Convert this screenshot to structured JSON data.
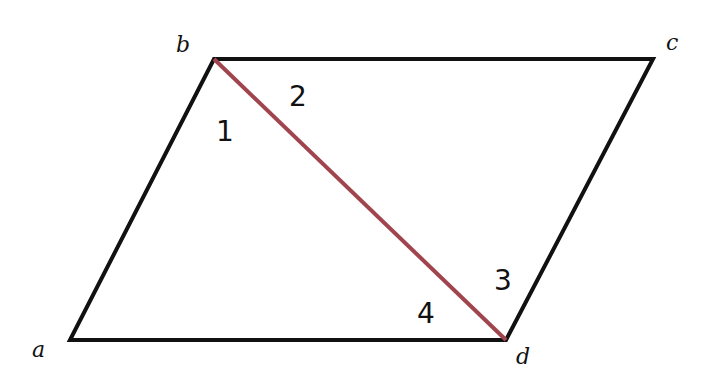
{
  "diagram": {
    "type": "parallelogram",
    "colors": {
      "edge": "#111111",
      "diagonal": "#a0444e",
      "background": "#ffffff"
    },
    "vertices": [
      {
        "id": "a",
        "label": "a",
        "x": 70,
        "y": 340,
        "label_x": 32,
        "label_y": 357
      },
      {
        "id": "b",
        "label": "b",
        "x": 214,
        "y": 59,
        "label_x": 176,
        "label_y": 52
      },
      {
        "id": "c",
        "label": "c",
        "x": 653,
        "y": 59,
        "label_x": 666,
        "label_y": 50
      },
      {
        "id": "d",
        "label": "d",
        "x": 506,
        "y": 340,
        "label_x": 516,
        "label_y": 364
      }
    ],
    "edges": [
      [
        "a",
        "b"
      ],
      [
        "b",
        "c"
      ],
      [
        "c",
        "d"
      ],
      [
        "d",
        "a"
      ]
    ],
    "diagonal": {
      "from": "b",
      "to": "d"
    },
    "angles": [
      {
        "label": "1",
        "x": 218,
        "y": 141
      },
      {
        "label": "2",
        "x": 290,
        "y": 106
      },
      {
        "label": "3",
        "x": 495,
        "y": 290
      },
      {
        "label": "4",
        "x": 418,
        "y": 323
      }
    ]
  }
}
